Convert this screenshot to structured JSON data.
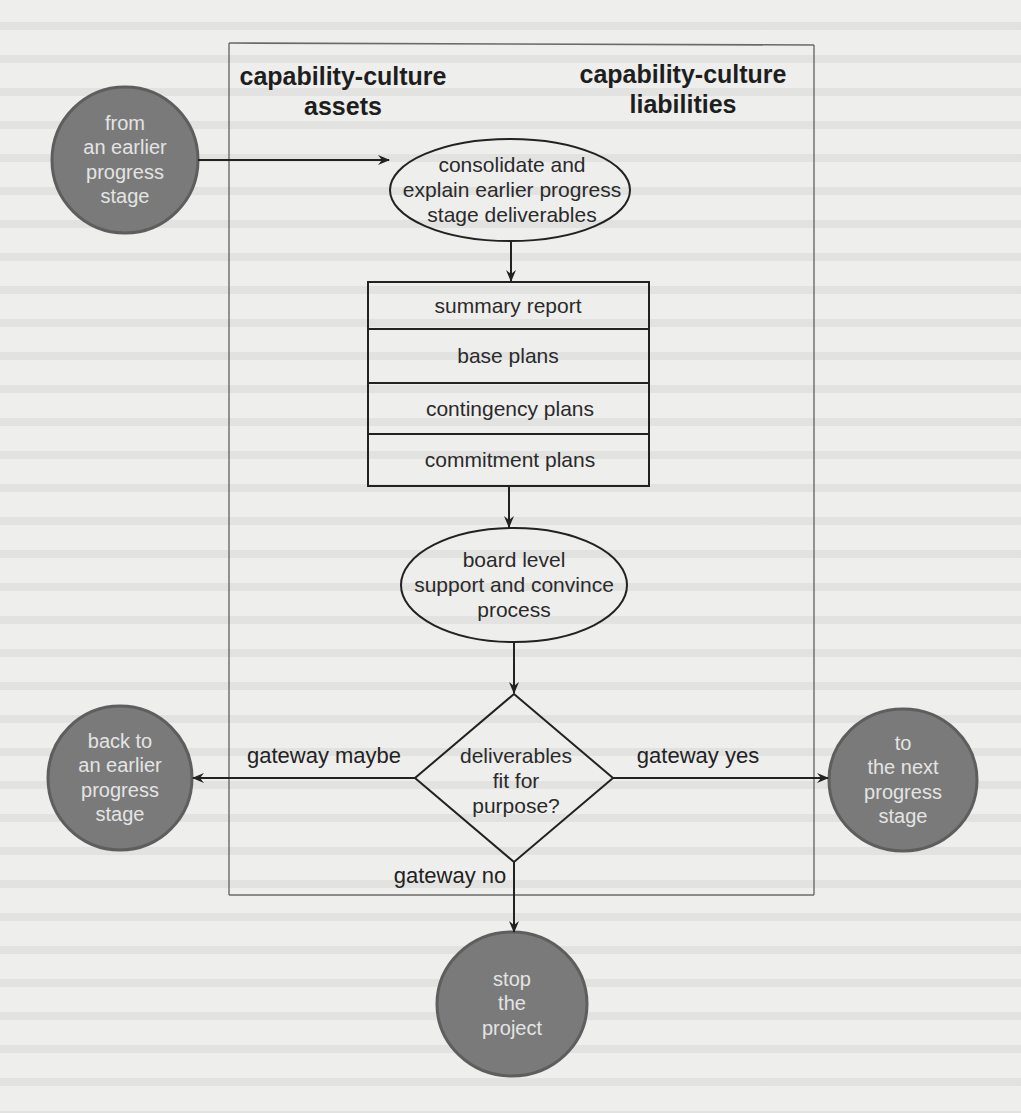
{
  "diagram": {
    "frame": {
      "left_header": "capability-culture\nassets",
      "right_header": "capability-culture\nliabilities"
    },
    "nodes": {
      "start": {
        "shape": "circle",
        "text": "from\nan earlier\nprogress\nstage"
      },
      "consolidate": {
        "shape": "ellipse",
        "text": "consolidate and\nexplain earlier progress\nstage deliverables"
      },
      "stack": {
        "shape": "box-stack",
        "rows": [
          "summary report",
          "base plans",
          "contingency plans",
          "commitment plans"
        ]
      },
      "board": {
        "shape": "ellipse",
        "text": "board level\nsupport and convince\nprocess"
      },
      "decision": {
        "shape": "diamond",
        "text": "deliverables\nfit for\npurpose?"
      },
      "back": {
        "shape": "circle",
        "text": "back to\nan earlier\nprogress\nstage"
      },
      "next": {
        "shape": "circle",
        "text": "to\nthe next\nprogress\nstage"
      },
      "stop": {
        "shape": "circle",
        "text": "stop\nthe\nproject"
      }
    },
    "edges": [
      {
        "from": "start",
        "to": "consolidate",
        "label": ""
      },
      {
        "from": "consolidate",
        "to": "stack",
        "label": ""
      },
      {
        "from": "stack",
        "to": "board",
        "label": ""
      },
      {
        "from": "board",
        "to": "decision",
        "label": ""
      },
      {
        "from": "decision",
        "to": "back",
        "label": "gateway maybe"
      },
      {
        "from": "decision",
        "to": "next",
        "label": "gateway yes"
      },
      {
        "from": "decision",
        "to": "stop",
        "label": "gateway no"
      }
    ],
    "colors": {
      "circle_fill": "#7a7a7a",
      "circle_border": "#5e5e5e",
      "circle_text": "#e4e4e4",
      "line": "#222222",
      "frame_line": "#6a6a6a",
      "page": "#eeeeec"
    }
  }
}
